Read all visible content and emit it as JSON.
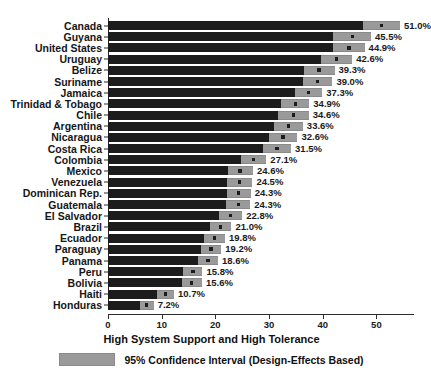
{
  "chart_data": {
    "type": "bar",
    "title": "",
    "subtitle": "",
    "xlabel": "High System Support and High Tolerance",
    "ylabel": "",
    "xlim": [
      0,
      57
    ],
    "xticks": [
      0,
      10,
      20,
      30,
      40,
      50
    ],
    "xtick_labels": [
      "0",
      "10",
      "20",
      "30",
      "40",
      "50"
    ],
    "grid": false,
    "orientation": "horizontal",
    "legend_position": "bottom-center",
    "legend": [
      {
        "label": "95% Confidence Interval (Design-Effects Based)",
        "color": "#9a9a9a"
      }
    ],
    "categories": [
      "Canada",
      "Guyana",
      "United States",
      "Uruguay",
      "Belize",
      "Suriname",
      "Jamaica",
      "Trinidad & Tobago",
      "Chile",
      "Argentina",
      "Nicaragua",
      "Costa Rica",
      "Colombia",
      "Mexico",
      "Venezuela",
      "Dominican Rep.",
      "Guatemala",
      "El Salvador",
      "Brazil",
      "Ecuador",
      "Paraguay",
      "Panama",
      "Peru",
      "Bolivia",
      "Haiti",
      "Honduras"
    ],
    "values": [
      51.0,
      45.5,
      44.9,
      42.6,
      39.3,
      39.0,
      37.3,
      34.9,
      34.6,
      33.6,
      32.6,
      31.5,
      27.1,
      24.6,
      24.5,
      24.3,
      24.3,
      22.8,
      21.0,
      19.8,
      19.2,
      18.6,
      15.8,
      15.6,
      10.7,
      7.2
    ],
    "value_labels": [
      "51.0%",
      "45.5%",
      "44.9%",
      "42.6%",
      "39.3%",
      "39.0%",
      "37.3%",
      "34.9%",
      "34.6%",
      "33.6%",
      "32.6%",
      "31.5%",
      "27.1%",
      "24.6%",
      "24.5%",
      "24.3%",
      "24.3%",
      "22.8%",
      "21.0%",
      "19.8%",
      "19.2%",
      "18.6%",
      "15.8%",
      "15.6%",
      "10.7%",
      "7.2%"
    ],
    "ci_low": [
      47.5,
      42.0,
      42.0,
      39.7,
      36.5,
      36.3,
      34.8,
      32.3,
      31.7,
      30.9,
      30.0,
      28.9,
      24.7,
      22.3,
      22.1,
      22.1,
      22.0,
      20.7,
      19.0,
      17.8,
      17.3,
      16.7,
      14.0,
      13.7,
      9.1,
      6.0
    ],
    "ci_high": [
      54.4,
      49.0,
      47.8,
      45.5,
      42.2,
      41.8,
      39.9,
      37.5,
      37.4,
      36.3,
      35.3,
      34.1,
      29.5,
      27.0,
      26.9,
      26.6,
      26.5,
      25.0,
      23.0,
      21.8,
      21.1,
      20.5,
      17.6,
      17.5,
      12.3,
      8.5
    ],
    "bar_color": "#1c1c1c",
    "ci_color": "#9a9a9a",
    "marker_color": "#1c1c1c"
  },
  "axis": {
    "x_title": "High System Support and High Tolerance"
  },
  "legend": {
    "ci_label": "95% Confidence Interval (Design-Effects Based)"
  }
}
